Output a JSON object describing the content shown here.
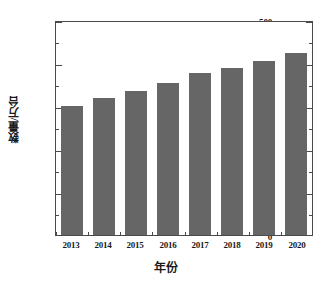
{
  "chart_data": {
    "type": "bar",
    "title": "",
    "subtitle": "",
    "xlabel": "年份",
    "ylabel": "数量/万台",
    "categories": [
      "2013",
      "2014",
      "2015",
      "2016",
      "2017",
      "2018",
      "2019",
      "2020"
    ],
    "values": [
      304,
      322,
      339,
      357,
      381,
      391,
      408,
      428
    ],
    "series": [
      {
        "name": "数量/万台",
        "values": [
          304,
          322,
          339,
          357,
          381,
          391,
          408,
          428
        ]
      }
    ],
    "ylim": [
      0,
      500
    ],
    "yticks": [
      0,
      100,
      200,
      300,
      400,
      500
    ],
    "ytick_labels": [
      "0",
      "100",
      "200",
      "300",
      "400",
      "500"
    ],
    "yminor_ticks": [
      50,
      150,
      250,
      350,
      450
    ],
    "xtick_labels": [
      "2013",
      "2014",
      "2015",
      "2016",
      "2017",
      "2018",
      "2019",
      "2020"
    ],
    "grid": false,
    "legend": null,
    "legend_position": "none",
    "bar_color": "#666666",
    "axis_color": "#4a4a4a",
    "background_color": "#ffffff",
    "annotations": []
  }
}
